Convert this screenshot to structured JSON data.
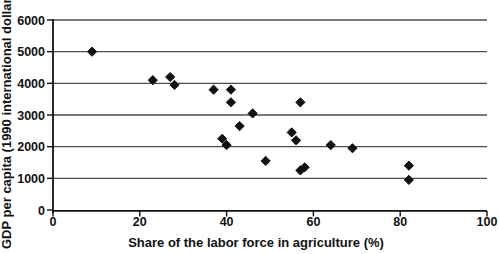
{
  "chart_data": {
    "type": "scatter",
    "title": "",
    "xlabel": "Share of the labor force in agriculture (%)",
    "ylabel": "GDP per capita (1990 international dollars)",
    "xlim": [
      0,
      100
    ],
    "ylim": [
      0,
      6000
    ],
    "xticks": [
      0,
      20,
      40,
      60,
      80,
      100
    ],
    "yticks": [
      0,
      1000,
      2000,
      3000,
      4000,
      5000,
      6000
    ],
    "grid": "horizontal",
    "legend": "none",
    "marker": "diamond",
    "marker_color": "#111111",
    "gridline_color": "#4d4d4d",
    "points": [
      {
        "x": 9,
        "y": 5000
      },
      {
        "x": 23,
        "y": 4100
      },
      {
        "x": 27,
        "y": 4200
      },
      {
        "x": 28,
        "y": 3950
      },
      {
        "x": 37,
        "y": 3800
      },
      {
        "x": 39,
        "y": 2250
      },
      {
        "x": 40,
        "y": 2050
      },
      {
        "x": 41,
        "y": 3800
      },
      {
        "x": 41,
        "y": 3400
      },
      {
        "x": 43,
        "y": 2650
      },
      {
        "x": 46,
        "y": 3050
      },
      {
        "x": 49,
        "y": 1550
      },
      {
        "x": 55,
        "y": 2450
      },
      {
        "x": 56,
        "y": 2200
      },
      {
        "x": 57,
        "y": 3400
      },
      {
        "x": 57,
        "y": 1250
      },
      {
        "x": 58,
        "y": 1350
      },
      {
        "x": 64,
        "y": 2050
      },
      {
        "x": 69,
        "y": 1950
      },
      {
        "x": 82,
        "y": 1400
      },
      {
        "x": 82,
        "y": 950
      }
    ]
  }
}
